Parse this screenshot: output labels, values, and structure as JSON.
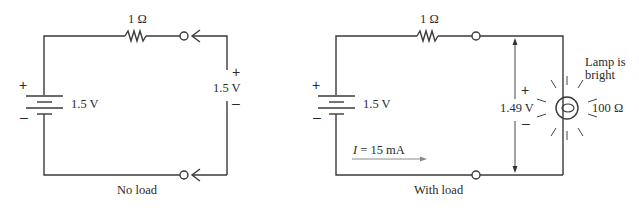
{
  "no_load_circuit": {
    "caption": "No load",
    "resistor_label": "1 Ω",
    "battery_label": "1.5 V",
    "battery_plus": "+",
    "battery_minus": "–",
    "measured_voltage": "1.5 V",
    "meter_plus": "+",
    "meter_minus": "–"
  },
  "with_load_circuit": {
    "caption": "With load",
    "resistor_label": "1 Ω",
    "battery_label": "1.5 V",
    "battery_plus": "+",
    "battery_minus": "–",
    "current_label_var": "I",
    "current_label_value": " = 15 mA",
    "measured_voltage": "1.49 V",
    "meter_plus": "+",
    "meter_minus": "–",
    "lamp_label_line1": "Lamp is",
    "lamp_label_line2": "bright",
    "lamp_resistance": "100 Ω"
  },
  "colors": {
    "wire": "#3a3a3a",
    "current_arrow": "#8a8a8a",
    "background": "#ffffff"
  }
}
